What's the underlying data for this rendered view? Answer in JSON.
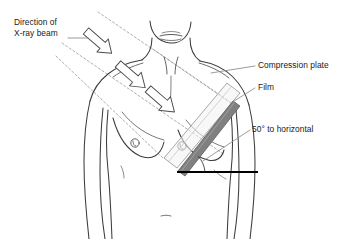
{
  "diagram": {
    "background_color": "#ffffff",
    "ink_color": "#1a1a1a",
    "body_outline_color": "#3c3c3c",
    "beam_dash_color": "#9a9a9a",
    "leader_color": "#8a8a8a",
    "film_color": "#808080",
    "plate_color": "#c8c8c8",
    "horizontal_line_color": "#000000"
  },
  "labels": {
    "direction": {
      "line1": "Direction of",
      "line2": "X-ray beam"
    },
    "compression_plate": "Compression plate",
    "film": "Film",
    "angle": "50° to horizontal"
  },
  "annotations": {
    "angle_value": "50°",
    "angle_reference": "to horizontal"
  },
  "arrows": [
    {
      "name": "beam-arrow-upper"
    },
    {
      "name": "beam-arrow-middle"
    },
    {
      "name": "beam-arrow-lower"
    }
  ]
}
